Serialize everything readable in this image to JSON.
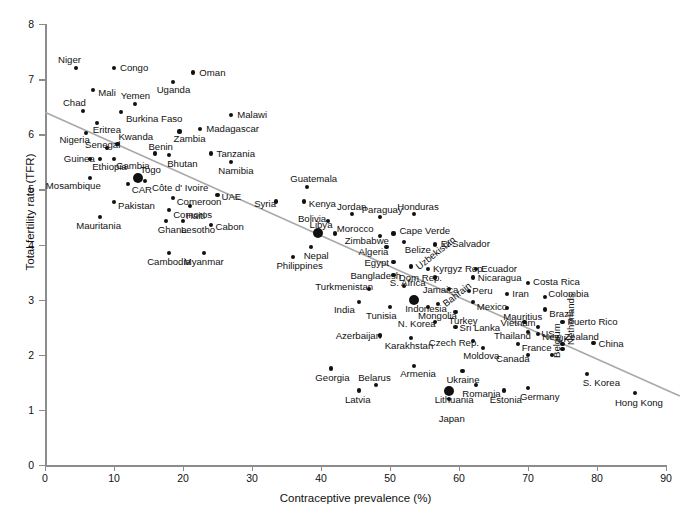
{
  "chart_data": {
    "type": "scatter",
    "title": "",
    "xlabel": "Contraceptive prevalence (%)",
    "ylabel": "Total fertility rate (TFR)",
    "xlim": [
      0,
      90
    ],
    "ylim": [
      0,
      8
    ],
    "xticks": [
      0,
      10,
      20,
      30,
      40,
      50,
      60,
      70,
      80,
      90
    ],
    "yticks": [
      0,
      1,
      2,
      3,
      4,
      5,
      6,
      7,
      8
    ],
    "grid": false,
    "legend": null,
    "trendline": {
      "type": "linear",
      "x_start": 0,
      "y_start": 6.4,
      "x_end": 92,
      "y_end": 1.25,
      "color": "#a8a8a8"
    },
    "points": [
      {
        "label": "Niger",
        "x": 4.5,
        "y": 7.2,
        "lx": -18,
        "ly": -13,
        "big": false
      },
      {
        "label": "Congo",
        "x": 10.0,
        "y": 7.2,
        "lx": 6,
        "ly": -5,
        "big": false
      },
      {
        "label": "Oman",
        "x": 21.5,
        "y": 7.12,
        "lx": 6,
        "ly": -5,
        "big": false
      },
      {
        "label": "Mali",
        "x": 7.0,
        "y": 6.8,
        "lx": 5,
        "ly": -2,
        "big": false
      },
      {
        "label": "Uganda",
        "x": 18.5,
        "y": 6.95,
        "lx": -16,
        "ly": 3,
        "big": false
      },
      {
        "label": "Yemen",
        "x": 13.0,
        "y": 6.55,
        "lx": -14,
        "ly": -13,
        "big": false
      },
      {
        "label": "Chad",
        "x": 5.5,
        "y": 6.42,
        "lx": -20,
        "ly": -13,
        "big": false
      },
      {
        "label": "Burkina Faso",
        "x": 11.0,
        "y": 6.4,
        "lx": 5,
        "ly": 2,
        "big": false
      },
      {
        "label": "Malawi",
        "x": 27.0,
        "y": 6.35,
        "lx": 6,
        "ly": -5,
        "big": false
      },
      {
        "label": "Eritrea",
        "x": 7.5,
        "y": 6.2,
        "lx": -4,
        "ly": 2,
        "big": false
      },
      {
        "label": "Madagascar",
        "x": 22.5,
        "y": 6.1,
        "lx": 6,
        "ly": -5,
        "big": false
      },
      {
        "label": "Nigeria",
        "x": 6.0,
        "y": 6.02,
        "lx": -27,
        "ly": 2,
        "big": false
      },
      {
        "label": "Zambia",
        "x": 19.5,
        "y": 6.05,
        "lx": -6,
        "ly": 3,
        "big": false
      },
      {
        "label": "Kwanda",
        "x": 10.5,
        "y": 5.82,
        "lx": 1,
        "ly": -12,
        "big": false
      },
      {
        "label": "Senegal",
        "x": 9.0,
        "y": 5.75,
        "lx": -22,
        "ly": -8,
        "big": false
      },
      {
        "label": "Tanzania",
        "x": 24.0,
        "y": 5.65,
        "lx": 6,
        "ly": -5,
        "big": false
      },
      {
        "label": "Benin",
        "x": 16.0,
        "y": 5.65,
        "lx": -7,
        "ly": -12,
        "big": false
      },
      {
        "label": "Gambia",
        "x": 10.0,
        "y": 5.55,
        "lx": 2,
        "ly": 2,
        "big": false
      },
      {
        "label": "Guinea",
        "x": 6.5,
        "y": 5.55,
        "lx": -26,
        "ly": -5,
        "big": false
      },
      {
        "label": "Bhutan",
        "x": 18.0,
        "y": 5.63,
        "lx": -2,
        "ly": 4,
        "big": false
      },
      {
        "label": "Namibia",
        "x": 27.0,
        "y": 5.5,
        "lx": -13,
        "ly": 4,
        "big": false
      },
      {
        "label": "Ethiopia",
        "x": 8.0,
        "y": 5.55,
        "lx": -8,
        "ly": 3,
        "big": false
      },
      {
        "label": "Togo",
        "x": 13.5,
        "y": 5.2,
        "lx": 2,
        "ly": -13,
        "big": true
      },
      {
        "label": "Guatemala",
        "x": 38.0,
        "y": 5.05,
        "lx": -17,
        "ly": -13,
        "big": false
      },
      {
        "label": "Mosambique",
        "x": 6.5,
        "y": 5.2,
        "lx": -44,
        "ly": 3,
        "big": false
      },
      {
        "label": "CAR",
        "x": 12.0,
        "y": 5.1,
        "lx": 4,
        "ly": 1,
        "big": false
      },
      {
        "label": "Côte d' Ivoire",
        "x": 14.5,
        "y": 5.15,
        "lx": 7,
        "ly": 2,
        "big": false
      },
      {
        "label": "UAE",
        "x": 25.0,
        "y": 4.9,
        "lx": 4,
        "ly": -3,
        "big": false
      },
      {
        "label": "Comeroon",
        "x": 18.5,
        "y": 4.85,
        "lx": 4,
        "ly": -1,
        "big": false
      },
      {
        "label": "Syria",
        "x": 33.5,
        "y": 4.78,
        "lx": -22,
        "ly": -3,
        "big": false
      },
      {
        "label": "Kenya",
        "x": 37.5,
        "y": 4.78,
        "lx": 5,
        "ly": -3,
        "big": false
      },
      {
        "label": "Pakistan",
        "x": 10.0,
        "y": 4.77,
        "lx": 4,
        "ly": -1,
        "big": false
      },
      {
        "label": "Comoros",
        "x": 18.0,
        "y": 4.62,
        "lx": 4,
        "ly": 0,
        "big": false
      },
      {
        "label": "Haiti",
        "x": 21.0,
        "y": 4.7,
        "lx": -4,
        "ly": 5,
        "big": false
      },
      {
        "label": "Jordan",
        "x": 44.5,
        "y": 4.55,
        "lx": -15,
        "ly": -12,
        "big": false
      },
      {
        "label": "Paraguay",
        "x": 48.5,
        "y": 4.5,
        "lx": -18,
        "ly": -12,
        "big": false
      },
      {
        "label": "Honduras",
        "x": 53.5,
        "y": 4.55,
        "lx": -17,
        "ly": -12,
        "big": false
      },
      {
        "label": "Bolivia",
        "x": 41.0,
        "y": 4.42,
        "lx": -30,
        "ly": -7,
        "big": false
      },
      {
        "label": "Mauritania",
        "x": 8.0,
        "y": 4.5,
        "lx": -24,
        "ly": 4,
        "big": false
      },
      {
        "label": "Libya",
        "x": 39.5,
        "y": 4.2,
        "lx": -8,
        "ly": -13,
        "big": true
      },
      {
        "label": "Ghana",
        "x": 17.5,
        "y": 4.42,
        "lx": -8,
        "ly": 4,
        "big": false
      },
      {
        "label": "Lesotho",
        "x": 20.0,
        "y": 4.42,
        "lx": -2,
        "ly": 4,
        "big": false
      },
      {
        "label": "Cabon",
        "x": 24.0,
        "y": 4.35,
        "lx": 5,
        "ly": -3,
        "big": false
      },
      {
        "label": "Morocco",
        "x": 42.0,
        "y": 4.2,
        "lx": 2,
        "ly": -9,
        "big": false
      },
      {
        "label": "Cape Verde",
        "x": 50.5,
        "y": 4.2,
        "lx": 6,
        "ly": -7,
        "big": false
      },
      {
        "label": "Zimbabwe",
        "x": 48.5,
        "y": 4.15,
        "lx": -35,
        "ly": 0,
        "big": false
      },
      {
        "label": "Belize",
        "x": 52.0,
        "y": 4.05,
        "lx": 1,
        "ly": 3,
        "big": false
      },
      {
        "label": "Nepal",
        "x": 38.5,
        "y": 3.95,
        "lx": -7,
        "ly": 4,
        "big": false
      },
      {
        "label": "Algeria",
        "x": 49.5,
        "y": 3.95,
        "lx": -28,
        "ly": 0,
        "big": false
      },
      {
        "label": "El Salvador",
        "x": 56.5,
        "y": 4.0,
        "lx": 6,
        "ly": -6,
        "big": false
      },
      {
        "label": "Philippines",
        "x": 36.0,
        "y": 3.78,
        "lx": -17,
        "ly": 4,
        "big": false
      },
      {
        "label": "Cambodia",
        "x": 18.0,
        "y": 3.85,
        "lx": -22,
        "ly": 4,
        "big": false
      },
      {
        "label": "Myanmar",
        "x": 23.0,
        "y": 3.85,
        "lx": -20,
        "ly": 4,
        "big": false
      },
      {
        "label": "Egypt",
        "x": 50.5,
        "y": 3.68,
        "lx": -29,
        "ly": -4,
        "big": false
      },
      {
        "label": "Uzbekistan",
        "x": 53.0,
        "y": 3.6,
        "lx": 3,
        "ly": -3,
        "big": false
      },
      {
        "label": "Kyrgyz Rep.",
        "x": 55.5,
        "y": 3.55,
        "lx": 5,
        "ly": -5,
        "big": false
      },
      {
        "label": "Ecuador",
        "x": 62.5,
        "y": 3.55,
        "lx": 5,
        "ly": -5,
        "big": false
      },
      {
        "label": "Bangladesh",
        "x": 50.5,
        "y": 3.45,
        "lx": -43,
        "ly": -4,
        "big": false
      },
      {
        "label": "Dom Rep.",
        "x": 56.5,
        "y": 3.4,
        "lx": -36,
        "ly": -5,
        "big": false
      },
      {
        "label": "Nicaragua",
        "x": 62.0,
        "y": 3.4,
        "lx": 5,
        "ly": -5,
        "big": false
      },
      {
        "label": "Costa Rica",
        "x": 70.0,
        "y": 3.3,
        "lx": 5,
        "ly": -6,
        "big": false
      },
      {
        "label": "Turkmenistan",
        "x": 47.0,
        "y": 3.2,
        "lx": -54,
        "ly": -7,
        "big": false
      },
      {
        "label": "S. Africa",
        "x": 52.0,
        "y": 3.25,
        "lx": -14,
        "ly": -8,
        "big": false
      },
      {
        "label": "Jamaica",
        "x": 58.5,
        "y": 3.2,
        "lx": -26,
        "ly": -4,
        "big": false
      },
      {
        "label": "Peru",
        "x": 61.5,
        "y": 3.15,
        "lx": 3,
        "ly": -5,
        "big": false
      },
      {
        "label": "Iran",
        "x": 67.0,
        "y": 3.1,
        "lx": 5,
        "ly": -5,
        "big": false
      },
      {
        "label": "Colombia",
        "x": 72.5,
        "y": 3.05,
        "lx": 3,
        "ly": -8,
        "big": false
      },
      {
        "label": "India",
        "x": 45.5,
        "y": 2.95,
        "lx": -25,
        "ly": 3,
        "big": false
      },
      {
        "label": "Indonesia",
        "x": 53.5,
        "y": 3.0,
        "lx": -9,
        "ly": 4,
        "big": true
      },
      {
        "label": "Mexico",
        "x": 62.0,
        "y": 2.95,
        "lx": 4,
        "ly": 0,
        "big": false
      },
      {
        "label": "Mauritius",
        "x": 67.0,
        "y": 2.85,
        "lx": -4,
        "ly": 4,
        "big": false
      },
      {
        "label": "Brazil",
        "x": 72.5,
        "y": 2.82,
        "lx": 4,
        "ly": -1,
        "big": false
      },
      {
        "label": "Bahrain",
        "x": 57.0,
        "y": 2.92,
        "lx": 3,
        "ly": -3,
        "big": false
      },
      {
        "label": "Tunisia",
        "x": 50.0,
        "y": 2.87,
        "lx": -24,
        "ly": 4,
        "big": false
      },
      {
        "label": "Mongolia",
        "x": 55.5,
        "y": 2.87,
        "lx": -10,
        "ly": 4,
        "big": false
      },
      {
        "label": "Turkey",
        "x": 59.5,
        "y": 2.78,
        "lx": -7,
        "ly": 4,
        "big": false
      },
      {
        "label": "Vietnam",
        "x": 69.5,
        "y": 2.6,
        "lx": -24,
        "ly": -4,
        "big": false
      },
      {
        "label": "Puerto Rico",
        "x": 75.0,
        "y": 2.6,
        "lx": 5,
        "ly": -5,
        "big": false
      },
      {
        "label": "N. Korea",
        "x": 56.5,
        "y": 2.6,
        "lx": -37,
        "ly": -3,
        "big": false
      },
      {
        "label": "Sri Lanka",
        "x": 59.5,
        "y": 2.5,
        "lx": 4,
        "ly": -4,
        "big": false
      },
      {
        "label": "US",
        "x": 71.5,
        "y": 2.5,
        "lx": 3,
        "ly": 2,
        "big": false
      },
      {
        "label": "Thailand",
        "x": 70.0,
        "y": 2.42,
        "lx": -34,
        "ly": -1,
        "big": false
      },
      {
        "label": "New Zealand",
        "x": 71.5,
        "y": 2.38,
        "lx": 4,
        "ly": -2,
        "big": false
      },
      {
        "label": "Azerbaijan",
        "x": 48.5,
        "y": 2.35,
        "lx": -44,
        "ly": -4,
        "big": false
      },
      {
        "label": "Karakhstan",
        "x": 53.0,
        "y": 2.3,
        "lx": -26,
        "ly": 3,
        "big": false
      },
      {
        "label": "Czech Rep.",
        "x": 62.0,
        "y": 2.25,
        "lx": -44,
        "ly": -3,
        "big": false
      },
      {
        "label": "France",
        "x": 68.5,
        "y": 2.2,
        "lx": 4,
        "ly": -1,
        "big": false
      },
      {
        "label": "UK",
        "x": 75.0,
        "y": 2.2,
        "lx": -6,
        "ly": -10,
        "big": false
      },
      {
        "label": "China",
        "x": 79.5,
        "y": 2.22,
        "lx": 5,
        "ly": -4,
        "big": false
      },
      {
        "label": "Moldova",
        "x": 63.5,
        "y": 2.12,
        "lx": -20,
        "ly": 3,
        "big": false
      },
      {
        "label": "Canada",
        "x": 70.0,
        "y": 2.0,
        "lx": -32,
        "ly": -1,
        "big": false
      },
      {
        "label": "Belgium",
        "x": 73.5,
        "y": 2.0,
        "lx": 0,
        "ly": 3,
        "big": false
      },
      {
        "label": "Netherlands",
        "x": 75.0,
        "y": 2.1,
        "lx": 3,
        "ly": -4,
        "big": false
      },
      {
        "label": "Georgia",
        "x": 41.5,
        "y": 1.75,
        "lx": -16,
        "ly": 4,
        "big": false
      },
      {
        "label": "Armenia",
        "x": 53.5,
        "y": 1.8,
        "lx": -14,
        "ly": 3,
        "big": false
      },
      {
        "label": "Ukraine",
        "x": 60.5,
        "y": 1.7,
        "lx": -16,
        "ly": 4,
        "big": false
      },
      {
        "label": "S. Korea",
        "x": 78.5,
        "y": 1.65,
        "lx": -4,
        "ly": 4,
        "big": false
      },
      {
        "label": "Belarus",
        "x": 48.0,
        "y": 1.45,
        "lx": -18,
        "ly": -12,
        "big": false
      },
      {
        "label": "Lithuania",
        "x": 58.5,
        "y": 1.35,
        "lx": -14,
        "ly": 4,
        "big": true
      },
      {
        "label": "Romania",
        "x": 62.5,
        "y": 1.45,
        "lx": -14,
        "ly": 4,
        "big": false
      },
      {
        "label": "Germany",
        "x": 70.0,
        "y": 1.4,
        "lx": -8,
        "ly": 4,
        "big": false
      },
      {
        "label": "Latvia",
        "x": 45.5,
        "y": 1.35,
        "lx": -14,
        "ly": 4,
        "big": false
      },
      {
        "label": "Estonia",
        "x": 66.5,
        "y": 1.35,
        "lx": -14,
        "ly": 4,
        "big": false
      },
      {
        "label": "Japan",
        "x": 58.5,
        "y": 1.2,
        "lx": -10,
        "ly": 15,
        "big": false
      },
      {
        "label": "Hong Kong",
        "x": 85.5,
        "y": 1.3,
        "lx": -20,
        "ly": 5,
        "big": false
      }
    ]
  },
  "caption": ""
}
